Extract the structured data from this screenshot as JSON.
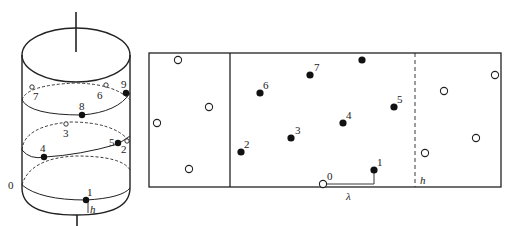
{
  "figure": {
    "cylinder": {
      "labels": {
        "zero": "0",
        "h": "h"
      },
      "points": [
        {
          "id": "1",
          "label": "1",
          "filled": true
        },
        {
          "id": "2",
          "label": "2",
          "filled": false
        },
        {
          "id": "3",
          "label": "3",
          "filled": false
        },
        {
          "id": "4",
          "label": "4",
          "filled": true
        },
        {
          "id": "5",
          "label": "5",
          "filled": true
        },
        {
          "id": "6",
          "label": "6",
          "filled": false
        },
        {
          "id": "7",
          "label": "7",
          "filled": false
        },
        {
          "id": "8",
          "label": "8",
          "filled": true
        },
        {
          "id": "9",
          "label": "9",
          "filled": true
        }
      ]
    },
    "unrolled": {
      "labels": {
        "zero": "0",
        "lambda": "λ",
        "h": "h"
      },
      "center_points": [
        {
          "label": "1"
        },
        {
          "label": "2"
        },
        {
          "label": "3"
        },
        {
          "label": "4"
        },
        {
          "label": "5"
        },
        {
          "label": "6"
        },
        {
          "label": "7"
        },
        {
          "label": ""
        }
      ],
      "left_copies_count": 4,
      "right_copies_count": 4
    }
  }
}
